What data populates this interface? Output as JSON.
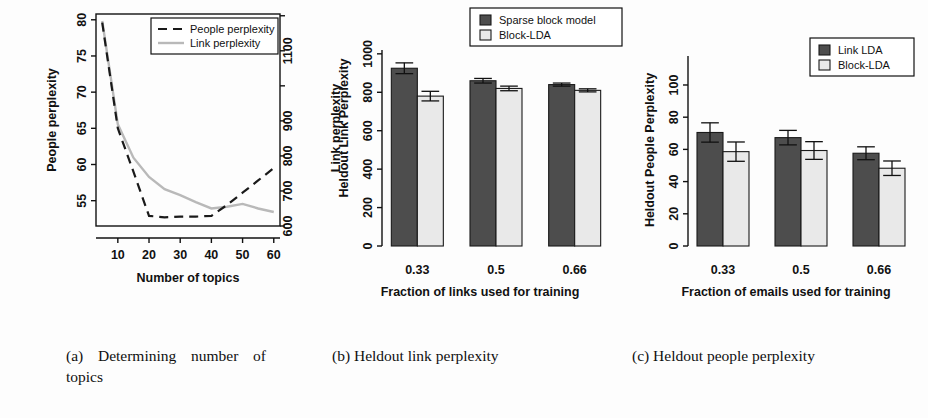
{
  "figure": {
    "panels": [
      "a",
      "b",
      "c"
    ],
    "captions": {
      "a": "(a) Determining number of topics",
      "b": "(b) Heldout link perplexity",
      "c": "(c) Heldout people perplexity"
    }
  },
  "colors": {
    "dark_bar": "#4d4d4d",
    "light_bar": "#e9e9e9",
    "link_line": "#b9b9b9",
    "people_line": "#1a1a1a",
    "axis": "#111111"
  },
  "chart_data": [
    {
      "id": "panel-a",
      "type": "line",
      "title": "",
      "xlabel": "Number of topics",
      "ylabel": "People perplexity",
      "y2label": "Link perplexity",
      "xlim": [
        3,
        62
      ],
      "xticks": [
        10,
        20,
        30,
        40,
        50,
        60
      ],
      "ylim": [
        51.5,
        80.8
      ],
      "yticks": [
        55,
        60,
        65,
        70,
        75,
        80
      ],
      "y2lim": [
        600,
        1205
      ],
      "y2ticks": [
        600,
        700,
        800,
        900,
        1100
      ],
      "grid": false,
      "legend_position": "top-right",
      "series": [
        {
          "name": "People perplexity",
          "axis": "left",
          "style": "dashed",
          "x": [
            5,
            10,
            15,
            20,
            25,
            30,
            35,
            40,
            45,
            50,
            55,
            60
          ],
          "values": [
            79.6,
            65.0,
            59.0,
            52.9,
            52.7,
            52.8,
            52.8,
            52.9,
            54.4,
            56.1,
            57.8,
            59.5
          ]
        },
        {
          "name": "Link perplexity",
          "axis": "right",
          "style": "solid",
          "x": [
            5,
            10,
            15,
            20,
            25,
            30,
            35,
            40,
            45,
            50,
            55,
            60
          ],
          "values": [
            1185,
            890,
            795,
            740,
            705,
            688,
            668,
            650,
            655,
            663,
            650,
            640
          ]
        }
      ]
    },
    {
      "id": "panel-b",
      "type": "bar",
      "title": "",
      "xlabel": "Fraction of links used for training",
      "ylabel": "Heldout Link Perplexity",
      "categories": [
        "0.33",
        "0.5",
        "0.66"
      ],
      "ylim": [
        0,
        1020
      ],
      "yticks": [
        0,
        200,
        400,
        600,
        800,
        1000
      ],
      "grid": false,
      "legend_position": "top-right",
      "series": [
        {
          "name": "Sparse block model",
          "fill": "dark",
          "values": [
            925,
            860,
            840
          ],
          "errors": [
            28,
            12,
            8
          ]
        },
        {
          "name": "Block-LDA",
          "fill": "light",
          "values": [
            780,
            820,
            810
          ],
          "errors": [
            25,
            12,
            8
          ]
        }
      ]
    },
    {
      "id": "panel-c",
      "type": "bar",
      "title": "",
      "xlabel": "Fraction of emails used for training",
      "ylabel": "Heldout People Perplexity",
      "categories": [
        "0.33",
        "0.5",
        "0.66"
      ],
      "ylim": [
        0,
        118
      ],
      "yticks": [
        0,
        20,
        40,
        60,
        80,
        100
      ],
      "grid": false,
      "legend_position": "top-right",
      "series": [
        {
          "name": "Link LDA",
          "fill": "dark",
          "values": [
            70.5,
            67.3,
            57.6
          ],
          "errors": [
            6.0,
            4.5,
            4.0
          ]
        },
        {
          "name": "Block-LDA",
          "fill": "light",
          "values": [
            58.6,
            59.3,
            48.3
          ],
          "errors": [
            6.0,
            5.5,
            4.5
          ]
        }
      ]
    }
  ]
}
